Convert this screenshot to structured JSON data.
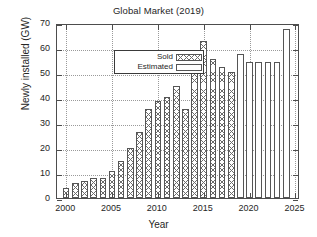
{
  "chart_data": {
    "type": "bar",
    "title": "Global Market (2019)",
    "xlabel": "Year",
    "ylabel": "Newly installed (GW)",
    "xlim": [
      1999,
      2025.5
    ],
    "ylim": [
      0,
      70
    ],
    "ytick_labels": [
      "0",
      "10",
      "20",
      "30",
      "40",
      "50",
      "60",
      "70"
    ],
    "ytick_values": [
      0,
      10,
      20,
      30,
      40,
      50,
      60,
      70
    ],
    "xtick_labels": [
      "2000",
      "2005",
      "2010",
      "2015",
      "2020",
      "2025"
    ],
    "xtick_values": [
      2000,
      2005,
      2010,
      2015,
      2020,
      2025
    ],
    "grid": true,
    "legend_position": "upper-left",
    "legend": [
      {
        "label": "Sold",
        "pattern": "cross-hatch",
        "color": "#6b6b6b"
      },
      {
        "label": "Estimated",
        "pattern": "empty",
        "color": "#ffffff"
      }
    ],
    "series": [
      {
        "name": "Sold",
        "x": [
          2000,
          2001,
          2002,
          2003,
          2004,
          2005,
          2006,
          2007,
          2008,
          2009,
          2010,
          2011,
          2012,
          2013,
          2014,
          2015,
          2016,
          2017,
          2018
        ],
        "values": [
          4,
          6,
          7,
          8,
          8,
          11,
          15,
          20,
          26.5,
          35.5,
          39,
          40.5,
          45,
          35.5,
          51,
          63,
          55.5,
          52.5,
          50.5
        ]
      },
      {
        "name": "Estimated",
        "x": [
          2019,
          2020,
          2021,
          2022,
          2023,
          2024
        ],
        "values": [
          57.5,
          54.5,
          54.5,
          54.5,
          54.5,
          67.5
        ]
      }
    ]
  }
}
